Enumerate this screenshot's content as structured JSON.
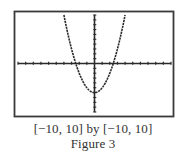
{
  "chart_data": {
    "type": "line",
    "title": "",
    "function": "y = x^2 - 6",
    "xlabel": "",
    "ylabel": "",
    "xlim": [
      -10,
      10
    ],
    "ylim": [
      -10,
      10
    ],
    "x_tick_spacing": 1,
    "y_tick_spacing": 1,
    "grid": false,
    "legend": null,
    "series": [
      {
        "name": "parabola",
        "x": [
          -4,
          -3,
          -2.45,
          -2,
          -1,
          0,
          1,
          2,
          2.45,
          3,
          4
        ],
        "y": [
          10,
          3,
          0,
          -2,
          -5,
          -6,
          -5,
          -2,
          0,
          3,
          10
        ]
      }
    ],
    "features": {
      "vertex": [
        0,
        -6
      ],
      "x_intercepts": [
        -2.45,
        2.45
      ],
      "y_intercept": -6
    }
  },
  "caption": {
    "window": "[−10, 10] by [−10, 10]",
    "figure_label": "Figure 3"
  },
  "colors": {
    "frame": "#3a3a3a",
    "axes": "#2a2a2a",
    "curve": "#2a2a2a",
    "background": "#ffffff"
  }
}
